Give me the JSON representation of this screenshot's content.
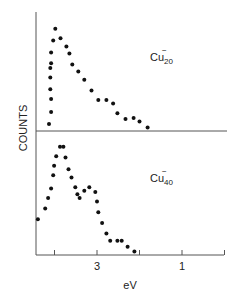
{
  "chart_data": {
    "type": "scatter",
    "title": "",
    "xlabel": "eV",
    "ylabel": "COUNTS",
    "x_reversed": true,
    "xlim": [
      4.4,
      -0.05
    ],
    "x_ticks": [
      4,
      3,
      2,
      1,
      0
    ],
    "x_tick_labels": [
      "",
      "3",
      "",
      "1",
      ""
    ],
    "ylim": [
      0,
      100
    ],
    "y_units": "relative counts (arbitrary)",
    "grid": false,
    "legend": "none (inline panel labels)",
    "panels": [
      {
        "name": "Cu20-",
        "label": {
          "base": "Cu",
          "subscript": "20",
          "superscript": "−"
        },
        "points": [
          {
            "x": 4.13,
            "y": 6
          },
          {
            "x": 4.08,
            "y": 16
          },
          {
            "x": 4.08,
            "y": 27
          },
          {
            "x": 4.1,
            "y": 35
          },
          {
            "x": 4.1,
            "y": 45
          },
          {
            "x": 4.1,
            "y": 53
          },
          {
            "x": 4.08,
            "y": 57
          },
          {
            "x": 4.08,
            "y": 66
          },
          {
            "x": 4.03,
            "y": 76
          },
          {
            "x": 3.98,
            "y": 86
          },
          {
            "x": 3.86,
            "y": 78
          },
          {
            "x": 3.72,
            "y": 71
          },
          {
            "x": 3.65,
            "y": 65
          },
          {
            "x": 3.58,
            "y": 56
          },
          {
            "x": 3.44,
            "y": 50
          },
          {
            "x": 3.3,
            "y": 43
          },
          {
            "x": 3.13,
            "y": 34
          },
          {
            "x": 2.97,
            "y": 26
          },
          {
            "x": 2.78,
            "y": 26
          },
          {
            "x": 2.62,
            "y": 23
          },
          {
            "x": 2.52,
            "y": 15
          },
          {
            "x": 2.33,
            "y": 10
          },
          {
            "x": 2.14,
            "y": 11
          },
          {
            "x": 2.0,
            "y": 8
          },
          {
            "x": 1.81,
            "y": 3
          }
        ]
      },
      {
        "name": "Cu40-",
        "label": {
          "base": "Cu",
          "subscript": "40",
          "superscript": "−"
        },
        "points": [
          {
            "x": 4.39,
            "y": 30
          },
          {
            "x": 4.22,
            "y": 39
          },
          {
            "x": 4.15,
            "y": 48
          },
          {
            "x": 4.08,
            "y": 56
          },
          {
            "x": 4.03,
            "y": 67
          },
          {
            "x": 4.01,
            "y": 75
          },
          {
            "x": 3.96,
            "y": 83
          },
          {
            "x": 3.87,
            "y": 91
          },
          {
            "x": 3.79,
            "y": 91
          },
          {
            "x": 3.74,
            "y": 82
          },
          {
            "x": 3.67,
            "y": 72
          },
          {
            "x": 3.6,
            "y": 65
          },
          {
            "x": 3.51,
            "y": 57
          },
          {
            "x": 3.46,
            "y": 51
          },
          {
            "x": 3.41,
            "y": 48
          },
          {
            "x": 3.3,
            "y": 54
          },
          {
            "x": 3.18,
            "y": 57
          },
          {
            "x": 3.04,
            "y": 53
          },
          {
            "x": 3.0,
            "y": 45
          },
          {
            "x": 2.97,
            "y": 36
          },
          {
            "x": 2.88,
            "y": 27
          },
          {
            "x": 2.78,
            "y": 18
          },
          {
            "x": 2.69,
            "y": 12
          },
          {
            "x": 2.52,
            "y": 12
          },
          {
            "x": 2.42,
            "y": 12
          },
          {
            "x": 2.28,
            "y": 7
          },
          {
            "x": 2.12,
            "y": 3
          }
        ]
      }
    ]
  },
  "labels": {
    "ylabel": "COUNTS",
    "xlabel": "eV",
    "tick_3": "3",
    "tick_1": "1",
    "panel_top_base": "Cu",
    "panel_top_sub": "20",
    "panel_top_sup": "−",
    "panel_bottom_base": "Cu",
    "panel_bottom_sub": "40",
    "panel_bottom_sup": "−"
  }
}
